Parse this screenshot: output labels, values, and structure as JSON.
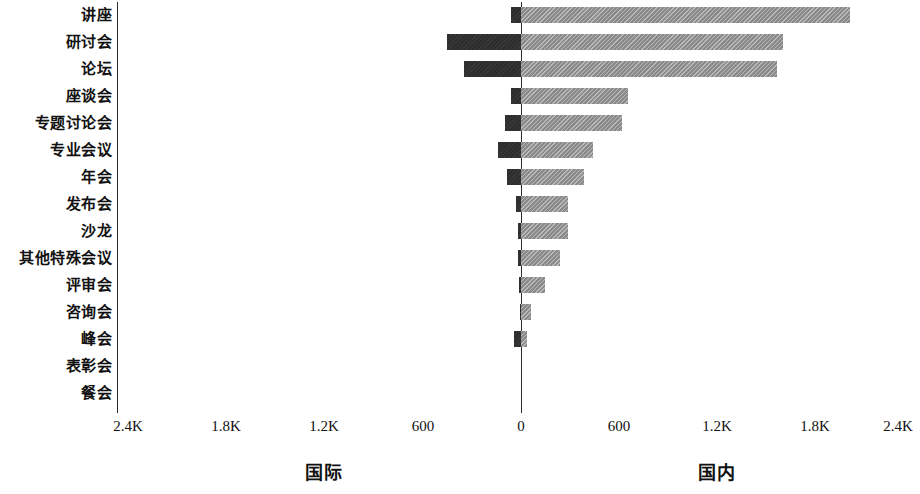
{
  "chart_data": {
    "type": "bar",
    "orientation": "horizontal",
    "style": "diverging-bidirectional-bar",
    "title": "",
    "subtitle": "",
    "xlabel": "",
    "ylabel": "",
    "grid": false,
    "legend_position": "below-axis-as-side-titles",
    "categories": [
      "讲座",
      "研讨会",
      "论坛",
      "座谈会",
      "专题讨论会",
      "专业会议",
      "年会",
      "发布会",
      "沙龙",
      "其他特殊会议",
      "评审会",
      "咨询会",
      "峰会",
      "表彰会",
      "餐会",
      "听证会"
    ],
    "series": [
      {
        "name": "国际",
        "side": "left",
        "color": "#2d2d2d",
        "values": [
          61,
          453,
          349,
          61,
          98,
          141,
          86,
          31,
          18,
          18,
          12,
          6,
          43,
          0,
          0,
          0
        ]
      },
      {
        "name": "国内",
        "side": "right",
        "color": "#8a8a8a",
        "values": [
          2014,
          1604,
          1567,
          655,
          618,
          441,
          386,
          288,
          288,
          239,
          147,
          61,
          37,
          0,
          0,
          0
        ]
      }
    ],
    "axis": {
      "tick_values_left": [
        2400,
        1800,
        1200,
        600
      ],
      "tick_zero": 0,
      "tick_values_right": [
        600,
        1200,
        1800,
        2400
      ],
      "tick_labels": [
        "2.4K",
        "1.8K",
        "1.2K",
        "600",
        "0",
        "600",
        "1.2K",
        "1.8K",
        "2.4K"
      ],
      "xlim": [
        -2400,
        2400
      ],
      "unit_suffix_thousand": "K"
    },
    "side_titles": {
      "left": "国际",
      "right": "国内"
    }
  },
  "labels": {
    "c0": "讲座",
    "c1": "研讨会",
    "c2": "论坛",
    "c3": "座谈会",
    "c4": "专题讨论会",
    "c5": "专业会议",
    "c6": "年会",
    "c7": "发布会",
    "c8": "沙龙",
    "c9": "其他特殊会议",
    "c10": "评审会",
    "c11": "咨询会",
    "c12": "峰会",
    "c13": "表彰会",
    "c14": "餐会",
    "c15": "听证会"
  },
  "ticks": {
    "t0": "2.4K",
    "t1": "1.8K",
    "t2": "1.2K",
    "t3": "600",
    "t4": "0",
    "t5": "600",
    "t6": "1.2K",
    "t7": "1.8K",
    "t8": "2.4K"
  },
  "side_titles": {
    "left": "国际",
    "right": "国内"
  },
  "colors": {
    "left_bar": "#2d2d2d",
    "right_bar": "#8a8a8a",
    "axis": "#2b2b2b",
    "text": "#111111",
    "background": "#ffffff"
  }
}
